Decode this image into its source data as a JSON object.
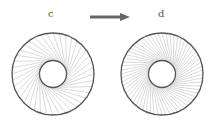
{
  "panels": [
    {
      "label": "c",
      "cx": 53,
      "cy": 74,
      "outer_r": 41,
      "inner_r": 13.5,
      "chords": 40,
      "twist": 1.2,
      "density": "sparse"
    },
    {
      "label": "d",
      "cx": 162,
      "cy": 74,
      "outer_r": 41,
      "inner_r": 13.5,
      "chords": 64,
      "twist": 1.9,
      "density": "dense"
    }
  ],
  "arrow": {
    "x1": 90,
    "x2": 130,
    "y": 17,
    "color": "#666666"
  },
  "colors": {
    "circle": "#555555",
    "chord": "#b5b5b5",
    "text": "#555555"
  }
}
